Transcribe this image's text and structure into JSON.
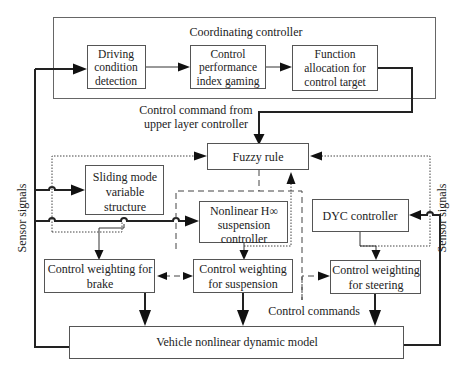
{
  "diagram": {
    "coordinating": {
      "title": "Coordinating controller",
      "driving": [
        "Driving",
        "condition",
        "detection"
      ],
      "gaming": [
        "Control",
        "performance",
        "index gaming"
      ],
      "allocation": [
        "Function",
        "allocation for",
        "control target"
      ]
    },
    "command_label": [
      "Control command from",
      "upper layer controller"
    ],
    "fuzzy": "Fuzzy rule",
    "sliding": [
      "Sliding mode",
      "variable",
      "structure"
    ],
    "hinf": [
      "Nonlinear H∞",
      "suspension",
      "controller"
    ],
    "dyc": "DYC controller",
    "w_brake": [
      "Control weighting for",
      "brake"
    ],
    "w_susp": [
      "Control weighting",
      "for suspension"
    ],
    "w_steer": [
      "Control weighting",
      "for steering"
    ],
    "control_commands": "Control commands",
    "vehicle": "Vehicle nonlinear dynamic model",
    "sensor_left": "Sensor signals",
    "sensor_right": "Sensor signals"
  }
}
